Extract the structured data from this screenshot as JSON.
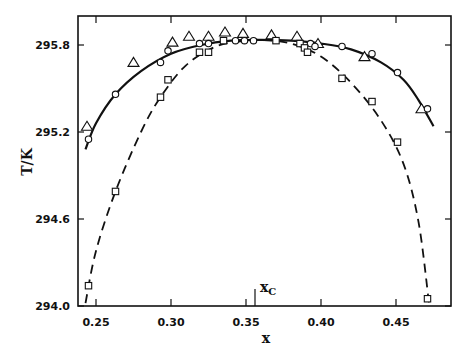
{
  "chart_data": {
    "type": "scatter",
    "title": "",
    "xlabel": "x",
    "ylabel": "T/K",
    "xlim": [
      0.238,
      0.487
    ],
    "ylim": [
      294.0,
      296.0
    ],
    "x_ticks": [
      0.25,
      0.3,
      0.35,
      0.4,
      0.45
    ],
    "x_tick_labels": [
      "0.25",
      "0.30",
      "0.35",
      "0.40",
      "0.45"
    ],
    "y_ticks": [
      294.0,
      294.6,
      295.2,
      295.8
    ],
    "y_tick_labels": [
      "294.0",
      "294.6",
      "295.2",
      "295.8"
    ],
    "grid": false,
    "legend": null,
    "annotations": [
      {
        "text": "x",
        "subscript": "C",
        "x": 0.356,
        "note": "critical composition marker tick"
      }
    ],
    "series": [
      {
        "name": "triangles",
        "marker": "triangle",
        "x": [
          0.244,
          0.275,
          0.301,
          0.312,
          0.325,
          0.336,
          0.348,
          0.367,
          0.384,
          0.398,
          0.429,
          0.467
        ],
        "y": [
          295.24,
          295.68,
          295.82,
          295.86,
          295.86,
          295.89,
          295.88,
          295.87,
          295.86,
          295.81,
          295.72,
          295.36
        ]
      },
      {
        "name": "circles",
        "marker": "circle",
        "line": "solid",
        "x": [
          0.245,
          0.263,
          0.293,
          0.298,
          0.319,
          0.325,
          0.343,
          0.349,
          0.355,
          0.393,
          0.396,
          0.414,
          0.434,
          0.451,
          0.471
        ],
        "y": [
          295.15,
          295.46,
          295.68,
          295.76,
          295.81,
          295.81,
          295.83,
          295.83,
          295.83,
          295.81,
          295.79,
          295.79,
          295.74,
          295.61,
          295.36
        ]
      },
      {
        "name": "squares",
        "marker": "square",
        "line": "dashed",
        "x": [
          0.245,
          0.263,
          0.293,
          0.298,
          0.319,
          0.325,
          0.335,
          0.37,
          0.386,
          0.389,
          0.391,
          0.414,
          0.434,
          0.451,
          0.471
        ],
        "y": [
          294.14,
          294.79,
          295.44,
          295.56,
          295.75,
          295.75,
          295.83,
          295.83,
          295.81,
          295.78,
          295.75,
          295.57,
          295.41,
          295.13,
          294.05
        ]
      }
    ],
    "fit_curves": [
      {
        "name": "solid-fit",
        "style": "solid",
        "x": [
          0.243,
          0.25,
          0.263,
          0.28,
          0.3,
          0.32,
          0.34,
          0.36,
          0.38,
          0.4,
          0.42,
          0.44,
          0.455,
          0.465,
          0.475
        ],
        "y": [
          295.08,
          295.26,
          295.46,
          295.62,
          295.74,
          295.8,
          295.83,
          295.835,
          295.83,
          295.81,
          295.77,
          295.68,
          295.56,
          295.42,
          295.24
        ]
      },
      {
        "name": "dashed-fit",
        "style": "dashed",
        "x": [
          0.243,
          0.25,
          0.263,
          0.28,
          0.293,
          0.31,
          0.33,
          0.35,
          0.36,
          0.38,
          0.4,
          0.42,
          0.44,
          0.455,
          0.465,
          0.472
        ],
        "y": [
          294.02,
          294.38,
          294.79,
          295.2,
          295.44,
          295.66,
          295.79,
          295.83,
          295.835,
          295.81,
          295.72,
          295.54,
          295.28,
          294.98,
          294.58,
          294.02
        ]
      }
    ]
  }
}
